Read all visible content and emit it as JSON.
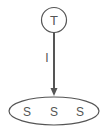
{
  "diagram": {
    "top_node": {
      "label": "T"
    },
    "edge": {
      "label": "I"
    },
    "group": {
      "items": [
        {
          "label": "S"
        },
        {
          "label": "S"
        },
        {
          "label": "S"
        }
      ]
    },
    "colors": {
      "stroke": "#555555",
      "text": "#555555",
      "background": "#ffffff"
    }
  }
}
